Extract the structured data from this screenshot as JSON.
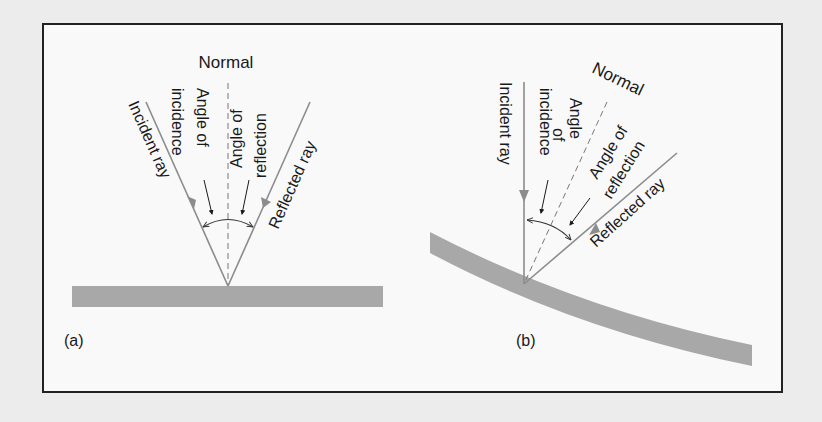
{
  "figure": {
    "panel_a": {
      "label": "(a)",
      "surface": "flat",
      "normal_label": "Normal",
      "incident_label": "Incident ray",
      "reflected_label": "Reflected ray",
      "angle_incidence_line1": "Angle of",
      "angle_incidence_line2": "incidence",
      "angle_reflection_line1": "Angle of",
      "angle_reflection_line2": "reflection"
    },
    "panel_b": {
      "label": "(b)",
      "surface": "curved",
      "normal_label": "Normal",
      "incident_label": "Incident ray",
      "reflected_label": "Reflected ray",
      "angle_incidence_line1": "Angle",
      "angle_incidence_line2": "of",
      "angle_incidence_line3": "incidence",
      "angle_reflection_line1": "Angle of",
      "angle_reflection_line2": "reflection"
    },
    "colors": {
      "frame": "#222222",
      "surface": "#a8a8a8",
      "ray": "#8c8c8c",
      "text": "#1a1a1a"
    }
  }
}
